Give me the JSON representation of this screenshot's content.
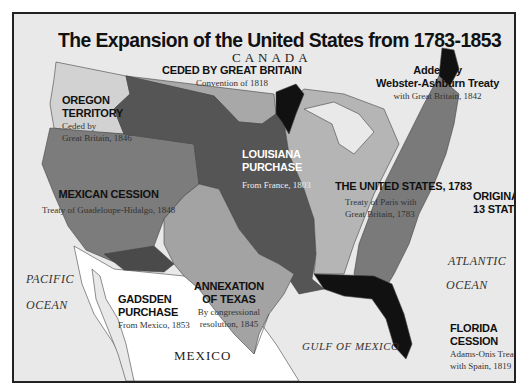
{
  "map": {
    "title": "The Expansion of the United States from 1783-1853",
    "colors": {
      "background": "#e9e9e9",
      "original_13_states": "#7a7a7a",
      "united_states_1783": "#b5b5b5",
      "louisiana_purchase": "#555555",
      "ceded_by_great_britain": "#a8a8a8",
      "oregon_territory": "#d2d2d2",
      "mexican_cession": "#7c7c7c",
      "annexation_of_texas": "#a3a3a3",
      "gadsden_purchase": "#4a4a4a",
      "florida_cession": "#111111",
      "webster_ashburton": "#111111",
      "mexico": "#ffffff"
    },
    "regions": {
      "oregon": {
        "name_line1": "OREGON",
        "name_line2": "TERRITORY",
        "detail_line1": "Ceded by",
        "detail_line2": "Great Britain, 1846"
      },
      "ceded_gb": {
        "name": "CEDED BY GREAT BRITAIN",
        "detail": "Convention of 1818"
      },
      "webster": {
        "name_line1": "Added by",
        "name_line2": "Webster-Ashburn Treaty",
        "detail": "with Great Britain, 1842"
      },
      "louisiana": {
        "name_line1": "LOUISIANA",
        "name_line2": "PURCHASE",
        "detail": "From France, 1803"
      },
      "mexican_cession": {
        "name": "MEXICAN CESSION",
        "detail": "Treaty of Guadeloupe-Hidalgo, 1848"
      },
      "us_1783": {
        "name": "THE UNITED STATES, 1783",
        "detail_line1": "Treaty of Paris with",
        "detail_line2": "Great Britain, 1783"
      },
      "original_13": {
        "name_line1": "ORIGINAL",
        "name_line2": "13 STATES"
      },
      "texas": {
        "name_line1": "ANNEXATION",
        "name_line2": "OF TEXAS",
        "detail_line1": "By congressional",
        "detail_line2": "resolution, 1845"
      },
      "gadsden": {
        "name_line1": "GADSDEN",
        "name_line2": "PURCHASE",
        "detail": "From Mexico, 1853"
      },
      "florida": {
        "name_line1": "FLORIDA",
        "name_line2": "CESSION",
        "detail_line1": "Adams-Onis Treaty",
        "detail_line2": "with Spain, 1819"
      }
    },
    "geography": {
      "canada": "CANADA",
      "mexico": "MEXICO",
      "pacific_line1": "PACIFIC",
      "pacific_line2": "OCEAN",
      "atlantic_line1": "ATLANTIC",
      "atlantic_line2": "OCEAN",
      "gulf": "GULF OF MEXICO"
    }
  }
}
